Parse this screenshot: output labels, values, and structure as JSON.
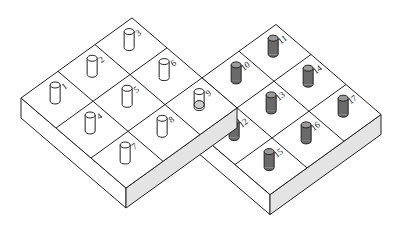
{
  "figure": {
    "left_board": {
      "cells": [
        {
          "label": "1",
          "peg": "light"
        },
        {
          "label": "2",
          "peg": "light"
        },
        {
          "label": "3",
          "peg": "light"
        },
        {
          "label": "4",
          "peg": "light"
        },
        {
          "label": "5",
          "peg": "light"
        },
        {
          "label": "6",
          "peg": "light"
        },
        {
          "label": "7",
          "peg": "light"
        },
        {
          "label": "8",
          "peg": "light"
        },
        {
          "label": "9",
          "peg": "hole"
        }
      ]
    },
    "right_board": {
      "cells": [
        {
          "label": "9",
          "peg": "hole"
        },
        {
          "label": "10",
          "peg": "dark"
        },
        {
          "label": "11",
          "peg": "dark"
        },
        {
          "label": "12",
          "peg": "dark"
        },
        {
          "label": "13",
          "peg": "dark"
        },
        {
          "label": "14",
          "peg": "dark"
        },
        {
          "label": "15",
          "peg": "dark"
        },
        {
          "label": "16",
          "peg": "dark"
        },
        {
          "label": "17",
          "peg": "dark"
        }
      ]
    },
    "colors": {
      "line": "#222222",
      "side_shade": "#e4e4e4",
      "light_peg": "#ffffff",
      "dark_peg": "#6a6a6a"
    }
  }
}
